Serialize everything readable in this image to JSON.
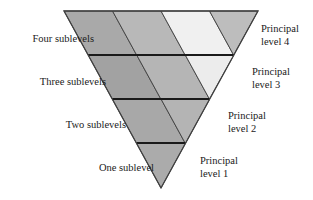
{
  "figure": {
    "type": "diagram",
    "background_color": "#ffffff",
    "outline_color": "#404040",
    "divider_color": "#1a1a1a",
    "geometry": {
      "top_left": [
        64,
        11
      ],
      "top_right": [
        258,
        11
      ],
      "apex": [
        161,
        188
      ],
      "row_count": 4,
      "row_divider_y": [
        55,
        99,
        143,
        188
      ]
    },
    "rows": [
      {
        "principal_level": 4,
        "sublevel_label": "Four sublevels",
        "principal_label_line1": "Principal",
        "principal_label_line2": "level 4",
        "cell_count": 4,
        "cell_colors": [
          "#a9a9a9",
          "#b8b8b8",
          "#f0f0f0",
          "#bdbdbd"
        ]
      },
      {
        "principal_level": 3,
        "sublevel_label": "Three sublevels",
        "principal_label_line1": "Principal",
        "principal_label_line2": "level 3",
        "cell_count": 3,
        "cell_colors": [
          "#a2a2a2",
          "#b5b5b5",
          "#ececec"
        ]
      },
      {
        "principal_level": 2,
        "sublevel_label": "Two sublevels",
        "principal_label_line1": "Principal",
        "principal_label_line2": "level 2",
        "cell_count": 2,
        "cell_colors": [
          "#a8a8a8",
          "#b4b4b4"
        ]
      },
      {
        "principal_level": 1,
        "sublevel_label": "One sublevel",
        "principal_label_line1": "Principal",
        "principal_label_line2": "level 1",
        "cell_count": 1,
        "cell_colors": [
          "#ababab"
        ]
      }
    ]
  },
  "labels": {
    "four_sublevels": "Four sublevels",
    "three_sublevels": "Three sublevels",
    "two_sublevels": "Two sublevels",
    "one_sublevel": "One sublevel",
    "principal_level_4": "Principal\nlevel 4",
    "principal_level_3": "Principal\nlevel 3",
    "principal_level_2": "Principal\nlevel 2",
    "principal_level_1": "Principal\nlevel 1"
  }
}
